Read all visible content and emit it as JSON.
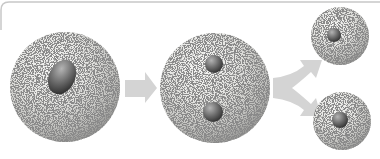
{
  "diagram": {
    "type": "process",
    "stages": [
      {
        "id": "parent-cell",
        "label": "",
        "nuclei": 1
      },
      {
        "id": "dividing-cell",
        "label": "",
        "nuclei": 2
      },
      {
        "id": "daughter-cell-top",
        "label": "",
        "nuclei": 1
      },
      {
        "id": "daughter-cell-bottom",
        "label": "",
        "nuclei": 1
      }
    ],
    "arrows": [
      {
        "from": "parent-cell",
        "to": "dividing-cell",
        "style": "straight"
      },
      {
        "from": "dividing-cell",
        "to": [
          "daughter-cell-top",
          "daughter-cell-bottom"
        ],
        "style": "forked"
      }
    ]
  },
  "colors": {
    "frame_border": "#c8c8c8",
    "cell_light": "#f4f4f2",
    "cell_mid": "#d6d6d3",
    "cell_dark": "#9a9a98",
    "nucleus_light": "#a8a8a8",
    "nucleus_dark": "#3c3c3c",
    "arrow": "#d4d4d4"
  }
}
